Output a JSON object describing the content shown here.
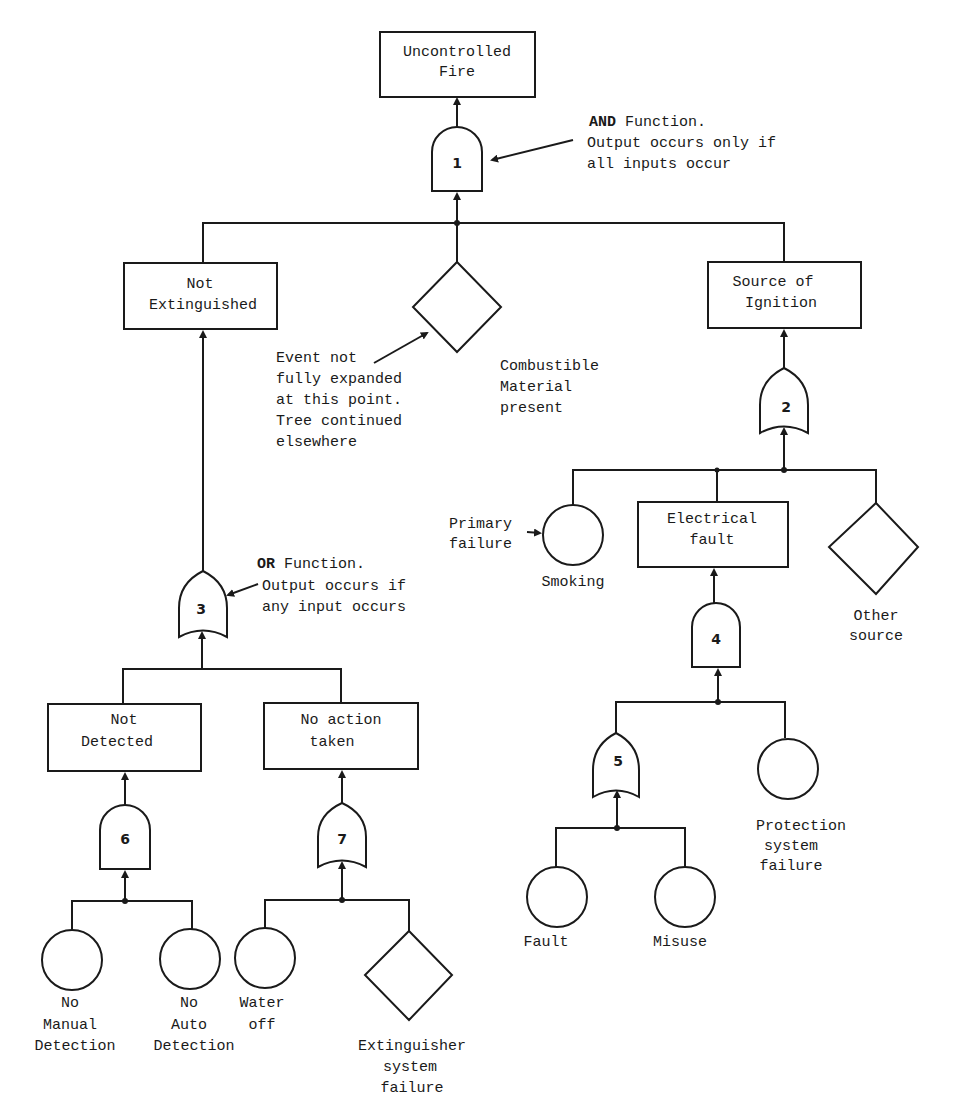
{
  "diagram": {
    "type": "fault-tree",
    "top_event": {
      "id": "uncontrolled-fire",
      "line1": "Uncontrolled",
      "line2": "Fire"
    },
    "events": {
      "not_extinguished": {
        "line1": "Not",
        "line2": "Extinguished"
      },
      "source_of_ignition": {
        "line1": "Source of",
        "line2": "Ignition"
      },
      "combustible": {
        "line1": "Combustible",
        "line2": "Material",
        "line3": "present"
      },
      "not_detected": {
        "line1": "Not",
        "line2": "Detected"
      },
      "no_action": {
        "line1": "No action",
        "line2": "taken"
      },
      "electrical_fault": {
        "line1": "Electrical",
        "line2": "fault"
      },
      "smoking": {
        "label": "Smoking"
      },
      "other_source": {
        "line1": "Other",
        "line2": "source"
      },
      "protection_failure": {
        "line1": "Protection",
        "line2": "system",
        "line3": "failure"
      },
      "fault": {
        "label": "Fault"
      },
      "misuse": {
        "label": "Misuse"
      },
      "no_manual": {
        "line1": "No",
        "line2": "Manual",
        "line3": "Detection"
      },
      "no_auto": {
        "line1": "No",
        "line2": "Auto",
        "line3": "Detection"
      },
      "water_off": {
        "line1": "Water",
        "line2": "off"
      },
      "extinguisher_failure": {
        "line1": "Extinguisher",
        "line2": "system",
        "line3": "failure"
      }
    },
    "gates": [
      {
        "number": "1",
        "type": "AND"
      },
      {
        "number": "2",
        "type": "OR"
      },
      {
        "number": "3",
        "type": "OR"
      },
      {
        "number": "4",
        "type": "AND"
      },
      {
        "number": "5",
        "type": "OR"
      },
      {
        "number": "6",
        "type": "AND"
      },
      {
        "number": "7",
        "type": "OR"
      }
    ],
    "annotations": {
      "and_note": {
        "bold": "AND",
        "line1_rest": " Function.",
        "line2": "Output occurs only if",
        "line3": "all inputs occur"
      },
      "or_note": {
        "bold": "OR",
        "line1_rest": " Function.",
        "line2": "Output occurs if",
        "line3": "any input occurs"
      },
      "undeveloped_note": {
        "line1": "Event not",
        "line2": "fully expanded",
        "line3": "at this point.",
        "line4": "Tree continued",
        "line5": "elsewhere"
      },
      "primary_note": {
        "line1": "Primary",
        "line2": "failure"
      }
    }
  }
}
